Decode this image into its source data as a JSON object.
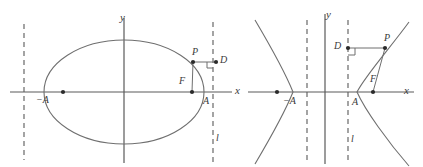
{
  "figure": {
    "stroke_color": "#6f6f6f",
    "axis_color": "#5a5a5a",
    "dash_color": "#5a5a5a",
    "point_color": "#2a2a2a",
    "label_color": "#3a3a3a",
    "background": "#ffffff",
    "width": 423,
    "height": 167
  },
  "left_diagram": {
    "name": "ellipse-diagram",
    "curve_type": "ellipse",
    "center": [
      124,
      92
    ],
    "semi_major_axis": 80,
    "semi_minor_axis": 52,
    "axes": {
      "x_axis": {
        "y": 92,
        "x_start": 10,
        "x_end": 232
      },
      "y_axis": {
        "x": 124,
        "y_start": 18,
        "y_end": 163
      }
    },
    "directrices": [
      {
        "x": 24,
        "label": ""
      },
      {
        "x": 213,
        "label": "l"
      }
    ],
    "points": [
      {
        "id": "vertex-left",
        "label": "−A",
        "x": 47,
        "y": 92,
        "dot": false
      },
      {
        "id": "focus-left",
        "label": "",
        "x": 63,
        "y": 92,
        "dot": true
      },
      {
        "id": "focus-right",
        "label": "F",
        "x": 192,
        "y": 92,
        "dot": true
      },
      {
        "id": "vertex-right",
        "label": "A",
        "x": 205,
        "y": 92,
        "dot": false
      },
      {
        "id": "point-p",
        "label": "P",
        "x": 193,
        "y": 62,
        "dot": true
      },
      {
        "id": "point-d",
        "label": "D",
        "x": 213,
        "y": 62,
        "dot": true
      }
    ],
    "segments": [
      {
        "id": "focal-radius-FP",
        "from": [
          192,
          92
        ],
        "to": [
          193,
          62
        ]
      },
      {
        "id": "directrix-distance-PD",
        "from": [
          193,
          62
        ],
        "to": [
          216,
          62
        ]
      }
    ],
    "right_angle_marker": {
      "at": [
        213,
        62
      ],
      "size": 6,
      "orientation": "down-left"
    },
    "labels": {
      "x_axis": "x",
      "y_axis": "y",
      "directrix": "l",
      "vertex_left": "−A",
      "vertex_right": "A",
      "focus": "F",
      "point_p": "P",
      "point_d": "D"
    }
  },
  "right_diagram": {
    "name": "hyperbola-diagram",
    "curve_type": "hyperbola",
    "center": [
      325,
      92
    ],
    "semi_transverse_axis": 32,
    "semi_conjugate_axis": 26,
    "axes": {
      "x_axis": {
        "y": 92,
        "x_start": 248,
        "x_end": 414
      },
      "y_axis": {
        "x": 325,
        "y_start": 14,
        "y_end": 164
      }
    },
    "directrices": [
      {
        "x": 307,
        "label": ""
      },
      {
        "x": 348,
        "label": "l"
      }
    ],
    "points": [
      {
        "id": "focus-left",
        "label": "",
        "x": 277,
        "y": 92,
        "dot": true
      },
      {
        "id": "vertex-left",
        "label": "−A",
        "x": 293,
        "y": 92,
        "dot": false
      },
      {
        "id": "vertex-right",
        "label": "A",
        "x": 357,
        "y": 92,
        "dot": false
      },
      {
        "id": "focus-right",
        "label": "F",
        "x": 373,
        "y": 92,
        "dot": true
      },
      {
        "id": "point-p",
        "label": "P",
        "x": 385,
        "y": 48,
        "dot": true
      },
      {
        "id": "point-d",
        "label": "D",
        "x": 348,
        "y": 48,
        "dot": true
      }
    ],
    "segments": [
      {
        "id": "focal-radius-FP",
        "from": [
          373,
          92
        ],
        "to": [
          385,
          48
        ]
      },
      {
        "id": "directrix-distance-DP",
        "from": [
          348,
          48
        ],
        "to": [
          385,
          48
        ]
      }
    ],
    "right_angle_marker": {
      "at": [
        348,
        48
      ],
      "size": 7,
      "orientation": "down-right"
    },
    "labels": {
      "x_axis": "x",
      "y_axis": "y",
      "directrix": "l",
      "vertex_left": "−A",
      "vertex_right": "A",
      "focus": "F",
      "point_p": "P",
      "point_d": "D"
    }
  }
}
